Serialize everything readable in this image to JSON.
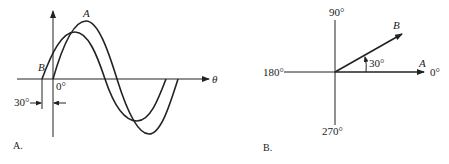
{
  "panel_a": {
    "caption": "A.",
    "x_axis_label": "θ",
    "curve_a_label": "A",
    "curve_b_label": "B",
    "zero_label": "0°",
    "offset_label": "30°",
    "phase_lead_degrees": 30
  },
  "panel_b": {
    "caption": "B.",
    "label_90": "90°",
    "label_180": "180°",
    "label_270": "270°",
    "label_0": "0°",
    "vector_a_label": "A",
    "vector_b_label": "B",
    "angle_label": "30°",
    "angle_degrees": 30
  },
  "colors": {
    "ink": "#222222",
    "background": "#ffffff"
  }
}
